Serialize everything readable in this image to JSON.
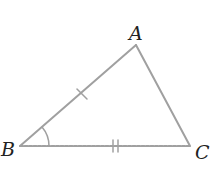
{
  "diagram": {
    "type": "triangle",
    "stroke_color": "#a0a0a0",
    "label_color": "#222222",
    "vertices": [
      {
        "name": "A",
        "x": 136,
        "y": 45,
        "label": "A"
      },
      {
        "name": "B",
        "x": 20,
        "y": 146,
        "label": "B"
      },
      {
        "name": "C",
        "x": 190,
        "y": 146,
        "label": "C"
      }
    ],
    "markings": [
      {
        "segment": "AB",
        "type": "single-tick"
      },
      {
        "segment": "BC",
        "type": "double-tick"
      },
      {
        "angle": "B",
        "type": "single-arc"
      }
    ]
  }
}
